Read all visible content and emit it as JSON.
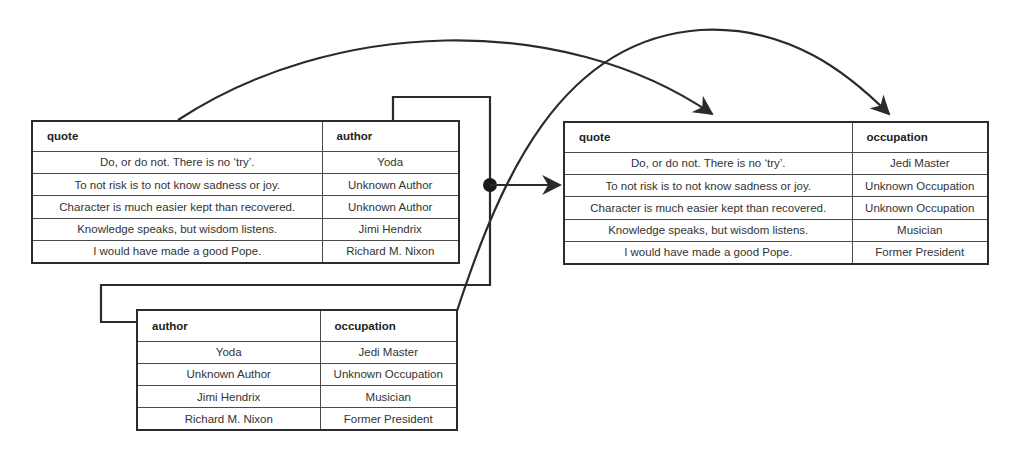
{
  "tables": {
    "quotes_authors": {
      "headers": [
        "quote",
        "author"
      ],
      "rows": [
        [
          "Do, or do not. There is no ‘try’.",
          "Yoda"
        ],
        [
          "To not risk is to not know sadness or joy.",
          "Unknown Author"
        ],
        [
          "Character is much easier kept than recovered.",
          "Unknown Author"
        ],
        [
          "Knowledge speaks, but wisdom listens.",
          "Jimi Hendrix"
        ],
        [
          "I would have made a good Pope.",
          "Richard M. Nixon"
        ]
      ]
    },
    "authors_occupations": {
      "headers": [
        "author",
        "occupation"
      ],
      "rows": [
        [
          "Yoda",
          "Jedi Master"
        ],
        [
          "Unknown Author",
          "Unknown Occupation"
        ],
        [
          "Jimi Hendrix",
          "Musician"
        ],
        [
          "Richard M. Nixon",
          "Former President"
        ]
      ]
    },
    "quotes_occupations": {
      "headers": [
        "quote",
        "occupation"
      ],
      "rows": [
        [
          "Do, or do not. There is no ‘try’.",
          "Jedi Master"
        ],
        [
          "To not risk is to not know sadness or joy.",
          "Unknown Occupation"
        ],
        [
          "Character is much easier kept than recovered.",
          "Unknown Occupation"
        ],
        [
          "Knowledge speaks, but wisdom listens.",
          "Musician"
        ],
        [
          "I would have made a good Pope.",
          "Former President"
        ]
      ]
    }
  },
  "colors": {
    "line": "#2b2b2b",
    "text": "#333333"
  }
}
